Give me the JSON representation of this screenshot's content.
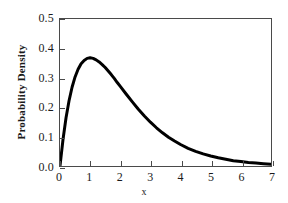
{
  "chart_data": {
    "type": "line",
    "title": "",
    "xlabel": "x",
    "ylabel": "Probability Density",
    "xlim": [
      0,
      7
    ],
    "ylim": [
      0.0,
      0.5
    ],
    "xticks": [
      0,
      1,
      2,
      3,
      4,
      5,
      6,
      7
    ],
    "xticklabels": [
      "0",
      "1",
      "2",
      "3",
      "4",
      "5",
      "6",
      "7"
    ],
    "yticks": [
      0.0,
      0.1,
      0.2,
      0.3,
      0.4,
      0.5
    ],
    "yticklabels": [
      "0.0",
      "0.1",
      "0.2",
      "0.3",
      "0.4",
      "0.5"
    ],
    "grid": false,
    "legend": false,
    "frame": true,
    "tick_direction": "in",
    "line_color": "#000000",
    "line_width": 3,
    "series": [
      {
        "name": "Gamma(shape=2, scale=1) probability density",
        "function": "f(x) = x * exp(-x)",
        "x": [
          0.0,
          0.1,
          0.2,
          0.3,
          0.4,
          0.5,
          0.6,
          0.7,
          0.8,
          0.9,
          1.0,
          1.1,
          1.2,
          1.3,
          1.4,
          1.5,
          1.6,
          1.7,
          1.8,
          1.9,
          2.0,
          2.2,
          2.4,
          2.6,
          2.8,
          3.0,
          3.2,
          3.4,
          3.6,
          3.8,
          4.0,
          4.25,
          4.5,
          4.75,
          5.0,
          5.25,
          5.5,
          5.75,
          6.0,
          6.25,
          6.5,
          6.75,
          7.0
        ],
        "y": [
          0.0,
          0.09,
          0.164,
          0.222,
          0.268,
          0.303,
          0.329,
          0.348,
          0.359,
          0.366,
          0.368,
          0.366,
          0.361,
          0.354,
          0.345,
          0.335,
          0.323,
          0.311,
          0.298,
          0.284,
          0.271,
          0.244,
          0.218,
          0.193,
          0.17,
          0.149,
          0.13,
          0.113,
          0.098,
          0.085,
          0.073,
          0.06,
          0.05,
          0.041,
          0.034,
          0.028,
          0.023,
          0.018,
          0.015,
          0.012,
          0.01,
          0.008,
          0.006
        ]
      }
    ]
  },
  "axes": {
    "xlabel": "x",
    "ylabel": "Probability Density"
  }
}
